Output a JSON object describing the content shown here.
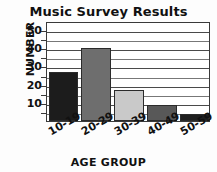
{
  "chart_data": {
    "type": "bar",
    "title": "Music Survey Results",
    "xlabel": "AGE GROUP",
    "ylabel": "NUMBER",
    "categories": [
      "10-19",
      "20-29",
      "30-39",
      "40-49",
      "50-59"
    ],
    "values": [
      27,
      40,
      17,
      9,
      4
    ],
    "ylim": [
      0,
      55
    ],
    "yticks": [
      10,
      20,
      30,
      40,
      50
    ],
    "ytick_labels": [
      "10",
      "20",
      "30",
      "40",
      "50"
    ],
    "minor_tick_step": 5,
    "grid": "horizontal",
    "legend": "none",
    "bar_colors": [
      "#1c1c1c",
      "#6e6e6e",
      "#c9c9c9",
      "#585858",
      "#1f1f1f"
    ],
    "bar_edge_color": "#2b2b2b",
    "frame_color": "#3a3a3a",
    "background": "#ffffff",
    "text_color": "#111111",
    "xtick_rotation_degrees": -30
  }
}
